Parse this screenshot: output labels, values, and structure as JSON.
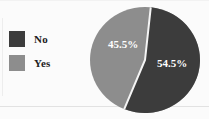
{
  "chart_data": {
    "type": "pie",
    "title": "",
    "subtitle": "",
    "xlabel": "",
    "ylabel": "",
    "grid": false,
    "legend_position": "left",
    "categories": [
      "No",
      "Yes"
    ],
    "values": [
      54.5,
      45.5
    ],
    "value_suffix": "%",
    "slices": [
      {
        "label": "No",
        "value": 54.5,
        "display": "54.5%",
        "color": "#3c3c3c",
        "start_angle_deg": 6,
        "sweep_deg": 196.2
      },
      {
        "label": "Yes",
        "value": 45.5,
        "display": "45.5%",
        "color": "#8d8d8d",
        "start_angle_deg": 202.2,
        "sweep_deg": 163.8
      }
    ],
    "annotations": [
      "54.5%",
      "45.5%"
    ]
  },
  "legend": {
    "items": [
      {
        "label": "No",
        "color": "#3c3c3c"
      },
      {
        "label": "Yes",
        "color": "#8d8d8d"
      }
    ]
  },
  "colors": {
    "no": "#3c3c3c",
    "yes": "#8d8d8d",
    "label_text": "#ffffff",
    "legend_text": "#1d1d1d",
    "background": "#fbfbfb",
    "divider": "#f4f4f4"
  },
  "pie_labels": {
    "no_label": "54.5%",
    "yes_label": "45.5%"
  }
}
